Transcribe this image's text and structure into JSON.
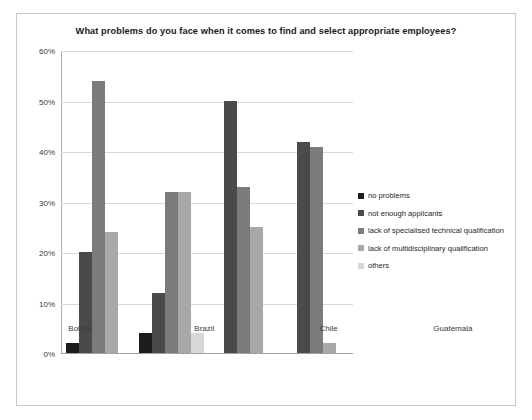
{
  "chart_data": {
    "type": "bar",
    "title": "What problems do you face when it comes to find and select appropriate employees?",
    "xlabel": "",
    "ylabel": "",
    "ylim": [
      0,
      60
    ],
    "ytick_labels": [
      "0%",
      "10%",
      "20%",
      "30%",
      "40%",
      "50%",
      "60%"
    ],
    "ytick_values": [
      0,
      10,
      20,
      30,
      40,
      50,
      60
    ],
    "grid": true,
    "legend_position": "right",
    "categories": [
      "Bolivia",
      "Brazil",
      "Chile",
      "Guatemala"
    ],
    "series": [
      {
        "name": "no problems",
        "color": "#1c1c1c",
        "values": [
          2,
          4,
          0,
          0
        ]
      },
      {
        "name": "not enough applicants",
        "color": "#4a4a4a",
        "values": [
          20,
          12,
          50,
          42
        ]
      },
      {
        "name": "lack of specialised technical qualification",
        "color": "#7b7b7b",
        "values": [
          54,
          32,
          33,
          41
        ]
      },
      {
        "name": "lack of multidisciplinary qualification",
        "color": "#a8a8a8",
        "values": [
          24,
          32,
          25,
          2
        ]
      },
      {
        "name": "others",
        "color": "#d8d8d8",
        "values": [
          0,
          4,
          0,
          0
        ]
      }
    ]
  }
}
